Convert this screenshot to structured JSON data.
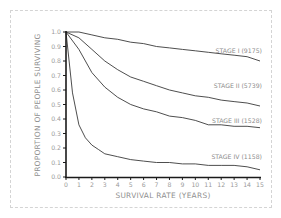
{
  "chart_data": {
    "type": "line",
    "title": "",
    "xlabel": "Survival rate (Years)",
    "ylabel": "Proportion of people surviving",
    "xlim": [
      0,
      15
    ],
    "ylim": [
      0.0,
      1.0
    ],
    "x_ticks": [
      "0",
      "1",
      "2",
      "3",
      "4",
      "5",
      "6",
      "7",
      "8",
      "9",
      "10",
      "11",
      "12",
      "13",
      "14",
      "15"
    ],
    "y_ticks": [
      "0.0",
      "0.1",
      "0.2",
      "0.3",
      "0.4",
      "0.5",
      "0.6",
      "0.7",
      "0.8",
      "0.9",
      "1.0"
    ],
    "grid": false,
    "legend_position": "inline-right",
    "series": [
      {
        "name": "Stage I (9175)",
        "x": [
          0,
          1,
          2,
          3,
          4,
          5,
          6,
          7,
          8,
          9,
          10,
          11,
          12,
          13,
          14,
          15
        ],
        "values": [
          1.0,
          1.0,
          0.98,
          0.96,
          0.95,
          0.93,
          0.92,
          0.9,
          0.89,
          0.88,
          0.87,
          0.86,
          0.85,
          0.84,
          0.83,
          0.8
        ]
      },
      {
        "name": "Stage II (5739)",
        "x": [
          0,
          1,
          2,
          3,
          4,
          5,
          6,
          7,
          8,
          9,
          10,
          11,
          12,
          13,
          14,
          15
        ],
        "values": [
          1.0,
          0.96,
          0.88,
          0.8,
          0.74,
          0.69,
          0.66,
          0.63,
          0.6,
          0.58,
          0.56,
          0.55,
          0.53,
          0.52,
          0.51,
          0.49
        ]
      },
      {
        "name": "Stage III (1528)",
        "x": [
          0,
          1,
          2,
          3,
          4,
          5,
          6,
          7,
          8,
          9,
          10,
          11,
          12,
          13,
          14,
          15
        ],
        "values": [
          1.0,
          0.88,
          0.72,
          0.62,
          0.55,
          0.5,
          0.47,
          0.45,
          0.42,
          0.41,
          0.39,
          0.36,
          0.36,
          0.35,
          0.35,
          0.34
        ]
      },
      {
        "name": "Stage IV (1158)",
        "x": [
          0,
          0.5,
          1,
          1.5,
          2,
          2.5,
          3,
          4,
          5,
          6,
          7,
          8,
          9,
          10,
          11,
          12,
          13,
          14,
          15
        ],
        "values": [
          1.0,
          0.58,
          0.36,
          0.27,
          0.22,
          0.19,
          0.16,
          0.14,
          0.12,
          0.11,
          0.1,
          0.1,
          0.09,
          0.09,
          0.08,
          0.08,
          0.08,
          0.07,
          0.05
        ]
      }
    ]
  },
  "labels": {
    "x_axis_title": "Survival rate (Years)",
    "y_axis_title": "Proportion of people surviving",
    "series": [
      "Stage I (9175)",
      "Stage II (5739)",
      "Stage III (1528)",
      "Stage IV (1158)"
    ]
  },
  "colors": {
    "line": "#3a3a3a",
    "axis": "#1a1a1a",
    "text": "#909090",
    "border": "#d4d4d4"
  }
}
